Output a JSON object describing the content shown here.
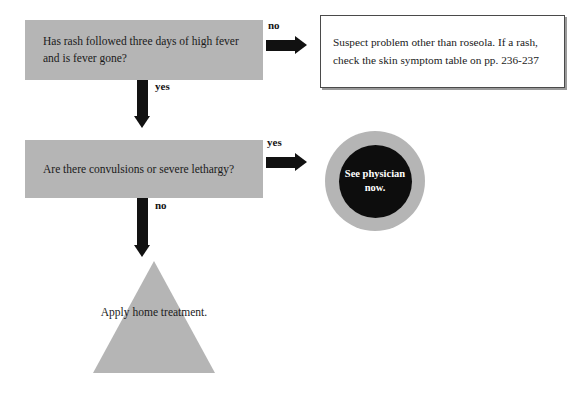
{
  "diagram": {
    "colors": {
      "shape_gray": "#b5b5b5",
      "arrow_black": "#111111",
      "circle_inner": "#0d0d0d",
      "circle_text": "#ffffff",
      "box_border": "#4a4a4a",
      "page_background": "#ffffff",
      "body_text": "#1a1a1a"
    },
    "nodes": {
      "decision_rash": {
        "shape": "rectangle",
        "text": "Has rash followed three days of high fever and is fever gone?"
      },
      "decision_convulsions": {
        "shape": "rectangle",
        "text": "Are there convulsions or severe lethargy?"
      },
      "outcome_suspect": {
        "shape": "bordered-box",
        "text": "Suspect problem other than roseola. If a rash, check the skin symptom table on pp. 236-237"
      },
      "outcome_physician": {
        "shape": "circle",
        "text": "See physician now."
      },
      "outcome_home": {
        "shape": "triangle",
        "text": "Apply home treatment."
      }
    },
    "edges": {
      "rash_no": {
        "label": "no",
        "direction": "right"
      },
      "rash_yes": {
        "label": "yes",
        "direction": "down"
      },
      "convulsions_yes": {
        "label": "yes",
        "direction": "right"
      },
      "convulsions_no": {
        "label": "no",
        "direction": "down"
      }
    }
  }
}
